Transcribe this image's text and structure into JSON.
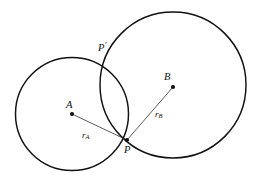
{
  "figure": {
    "background_color": "#ffffff",
    "stroke_color": "#111111",
    "width": 256,
    "height": 182
  },
  "circles": [
    {
      "id": "circle-a",
      "center_label": "A",
      "cx": 72,
      "cy": 114,
      "r": 56.5,
      "stroke_width": 1.4
    },
    {
      "id": "circle-b",
      "center_label": "B",
      "cx": 173,
      "cy": 85,
      "r": 73,
      "stroke_width": 1.4
    }
  ],
  "points": [
    {
      "id": "point-a",
      "label": "A",
      "x": 72,
      "y": 114,
      "dot": true,
      "label_x": 66,
      "label_y": 100
    },
    {
      "id": "point-b",
      "label": "B",
      "x": 173,
      "y": 87,
      "dot": true,
      "label_x": 163,
      "label_y": 72
    },
    {
      "id": "point-p",
      "label": "P",
      "x": 127,
      "y": 140,
      "dot": true,
      "label_x": 124,
      "label_y": 145
    },
    {
      "id": "point-p-prime",
      "label": "P",
      "prime": "′",
      "x": 113,
      "y": 55,
      "dot": false,
      "label_x": 98,
      "label_y": 41
    }
  ],
  "segments": [
    {
      "id": "radius-a",
      "from": "A",
      "to": "P",
      "x1": 72,
      "y1": 114,
      "x2": 127,
      "y2": 140,
      "stroke_width": 0.8
    },
    {
      "id": "radius-b",
      "from": "B",
      "to": "P",
      "x1": 173,
      "y1": 87,
      "x2": 127,
      "y2": 140,
      "stroke_width": 0.8
    }
  ],
  "labels": {
    "center_a": "A",
    "center_b": "B",
    "intersection_lower": "P",
    "intersection_upper": "P",
    "intersection_upper_prime": "′",
    "radius_a_symbol": "r",
    "radius_a_subscript": "A",
    "radius_b_symbol": "r",
    "radius_b_subscript": "B"
  },
  "radius_labels": [
    {
      "id": "r-a-label",
      "symbol": "r",
      "subscript": "A",
      "x": 82,
      "y": 131
    },
    {
      "id": "r-b-label",
      "symbol": "r",
      "subscript": "B",
      "x": 155,
      "y": 110
    }
  ]
}
